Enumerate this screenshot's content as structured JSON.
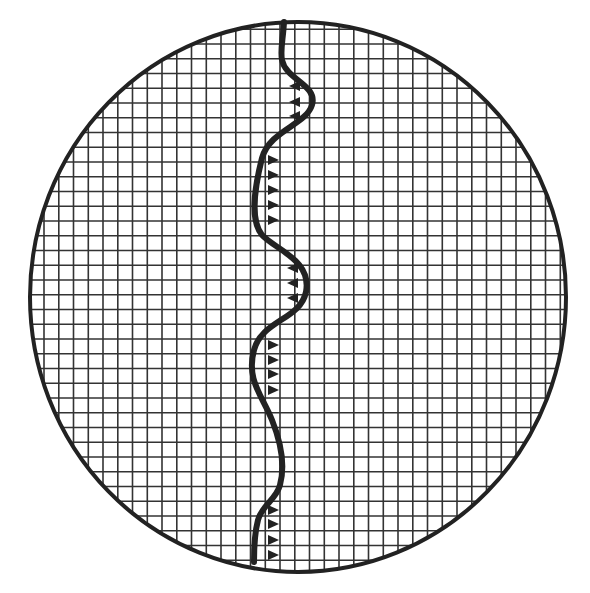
{
  "diagram": {
    "type": "circular-grid-with-boundary-line",
    "colors": {
      "background": "#ffffff",
      "ink": "#222222",
      "grid": "#333333"
    },
    "circle": {
      "cx": 298,
      "cy": 297,
      "rx": 268,
      "ry": 275
    },
    "grid": {
      "spacing": 14.75,
      "origin_x": 14.5,
      "origin_y": 14.5
    },
    "boundary_path": "M284,22 C283,40 280,50 282,60 C286,80 318,85 312,105 C306,125 270,130 262,158 C254,190 250,220 262,235 C276,250 312,260 306,292 C300,320 262,320 254,350 C246,380 262,395 272,420 C284,450 284,470 280,485 C276,500 262,505 258,520 C254,535 254,550 254,562",
    "markers": [
      {
        "x": 300,
        "y": 86,
        "dir": "left"
      },
      {
        "x": 300,
        "y": 102,
        "dir": "left"
      },
      {
        "x": 300,
        "y": 116,
        "dir": "left"
      },
      {
        "x": 268,
        "y": 160,
        "dir": "right"
      },
      {
        "x": 268,
        "y": 175,
        "dir": "right"
      },
      {
        "x": 268,
        "y": 190,
        "dir": "right"
      },
      {
        "x": 268,
        "y": 205,
        "dir": "right"
      },
      {
        "x": 268,
        "y": 220,
        "dir": "right"
      },
      {
        "x": 298,
        "y": 268,
        "dir": "left"
      },
      {
        "x": 298,
        "y": 283,
        "dir": "left"
      },
      {
        "x": 298,
        "y": 298,
        "dir": "left"
      },
      {
        "x": 268,
        "y": 345,
        "dir": "right"
      },
      {
        "x": 268,
        "y": 360,
        "dir": "right"
      },
      {
        "x": 268,
        "y": 374,
        "dir": "right"
      },
      {
        "x": 268,
        "y": 390,
        "dir": "right"
      },
      {
        "x": 268,
        "y": 510,
        "dir": "right"
      },
      {
        "x": 268,
        "y": 524,
        "dir": "right"
      },
      {
        "x": 268,
        "y": 540,
        "dir": "right"
      },
      {
        "x": 268,
        "y": 555,
        "dir": "right"
      }
    ]
  }
}
